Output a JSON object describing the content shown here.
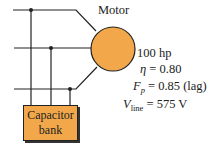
{
  "diagram": {
    "motor_label": "Motor",
    "capacitor_label_line1": "Capacitor",
    "capacitor_label_line2": "bank",
    "specs": {
      "power": "100 hp",
      "efficiency_symbol": "η",
      "efficiency_value": "= 0.80",
      "pf_symbol": "F",
      "pf_sub": "p",
      "pf_value": "= 0.85 (lag)",
      "vline_symbol": "V",
      "vline_sub": "line",
      "vline_value": "= 575 V"
    },
    "colors": {
      "motor_fill": "#f2a84a",
      "capacitor_fill": "#f2a84a",
      "wire": "#222222"
    }
  }
}
